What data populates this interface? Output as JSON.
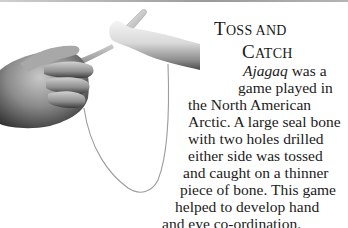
{
  "heading": {
    "line1_cap": "T",
    "line1_rest": "OSS AND",
    "line2_cap": "C",
    "line2_rest": "ATCH"
  },
  "body": {
    "lines": [
      {
        "italic": "Ajagaq",
        "text": " was a"
      },
      {
        "text": "game played in"
      },
      {
        "text": "the North American"
      },
      {
        "text": "Arctic. A large seal bone"
      },
      {
        "text": "with two holes drilled"
      },
      {
        "text": "either side was tossed"
      },
      {
        "text": "and caught on a thinner"
      },
      {
        "text": "piece of bone. This game"
      },
      {
        "text": "helped to develop hand"
      },
      {
        "text": "and eye co-ordination."
      }
    ]
  },
  "photo": {
    "subject": "hand holding ajagaq bone toy with string",
    "palette": {
      "bone_light": "#e6e6e6",
      "bone_shadow": "#6e6e6e",
      "skin_light": "#bdbdbd",
      "skin_dark": "#3a3a3a",
      "string": "#9c9c9c"
    }
  }
}
